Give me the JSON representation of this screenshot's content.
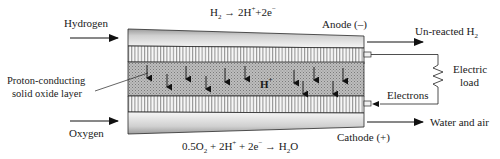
{
  "diagram": {
    "type": "proton-conducting solid oxide fuel cell schematic",
    "inputs": {
      "top": "Hydrogen",
      "bottom": "Oxygen"
    },
    "outputs": {
      "top": "Un-reacted H",
      "top_subscript": "2",
      "bottom": "Water and air"
    },
    "electrodes": {
      "anode": "Anode (–)",
      "cathode": "Cathode (+)"
    },
    "layer_label_line1": "Proton-conducting",
    "layer_label_line2": "solid oxide layer",
    "ion_label": "H",
    "ion_charge": "+",
    "load_label_line1": "Electric",
    "load_label_line2": "load",
    "electrons_label": "Electrons",
    "anode_reaction": {
      "lhs": "H",
      "lhs_sub": "2",
      "arrow": " → 2H",
      "sup1": "+",
      "mid": "+2e",
      "sup2": "−"
    },
    "cathode_reaction": {
      "a": "0.5O",
      "a_sub": "2",
      "b": " + 2H",
      "b_sup": "+",
      "c": " + 2e",
      "c_sup": "−",
      "d": " → H",
      "d_sub": "2",
      "e": "O"
    },
    "colors": {
      "outline": "#2a2a2a",
      "electrode_gray_light": "#f0f0f0",
      "electrode_gray_dark": "#b8b8b8",
      "stripe_bg": "#f4f4f4",
      "stripe_line": "#555555",
      "proton_layer": "#b0b0b0"
    }
  }
}
